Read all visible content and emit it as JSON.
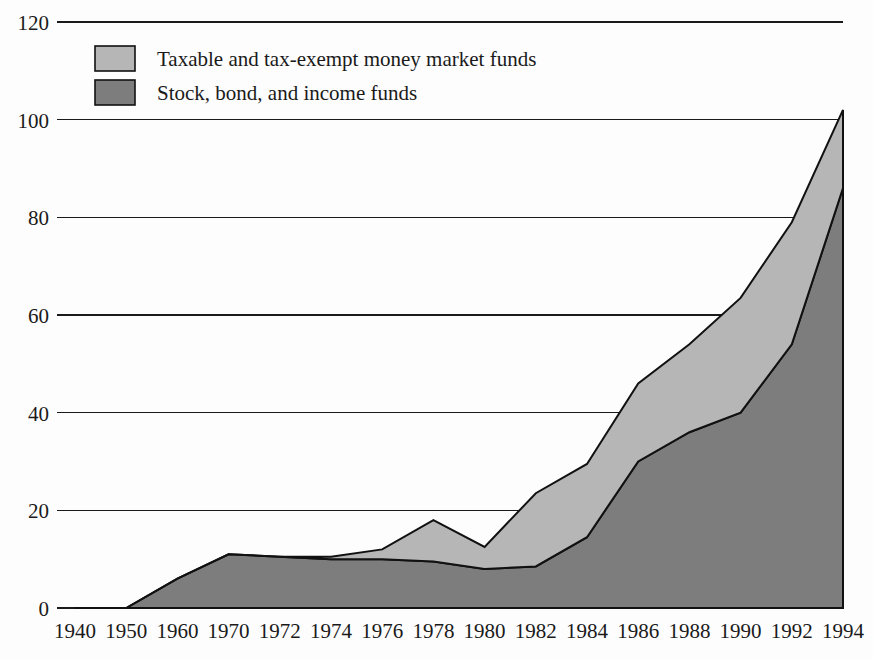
{
  "chart_data": {
    "type": "area",
    "stacked": true,
    "title": "",
    "subtitle": "",
    "xlabel": "",
    "ylabel": "",
    "categories": [
      "1940",
      "1950",
      "1960",
      "1970",
      "1972",
      "1974",
      "1976",
      "1978",
      "1980",
      "1982",
      "1984",
      "1986",
      "1988",
      "1990",
      "1992",
      "1994"
    ],
    "x": [
      1940,
      1950,
      1960,
      1970,
      1972,
      1974,
      1976,
      1978,
      1980,
      1982,
      1984,
      1986,
      1988,
      1990,
      1992,
      1994
    ],
    "series": [
      {
        "name": "Stock, bond, and income funds",
        "color": "#7d7d7d",
        "values": [
          0,
          0,
          6,
          11,
          10.5,
          10,
          10,
          9.5,
          8,
          8.5,
          14.5,
          30,
          36,
          40,
          54,
          86
        ]
      },
      {
        "name": "Taxable and tax-exempt money market funds",
        "color": "#b6b6b6",
        "values": [
          0,
          0,
          0,
          0,
          0,
          0.5,
          2,
          8.5,
          4.5,
          15,
          15,
          16,
          18,
          23.5,
          25,
          16
        ]
      }
    ],
    "totals": [
      0,
      0,
      6,
      11,
      10.5,
      10.5,
      12,
      18,
      12.5,
      23.5,
      29.5,
      46,
      54,
      63.5,
      79,
      102
    ],
    "ylim": [
      0,
      120
    ],
    "yticks": [
      0,
      20,
      40,
      60,
      80,
      100,
      120
    ],
    "ytick_labels": [
      "0",
      "20",
      "40",
      "60",
      "80",
      "100",
      "120"
    ],
    "grid": true,
    "grid_axis": "y",
    "legend_position": "upper-left-inside",
    "annotations": []
  },
  "legend": {
    "items": [
      {
        "label": "Taxable and tax-exempt money market funds",
        "color": "#b6b6b6"
      },
      {
        "label": "Stock, bond, and income funds",
        "color": "#7d7d7d"
      }
    ]
  },
  "axes": {
    "y_labels": [
      "120",
      "100",
      "80",
      "60",
      "40",
      "20",
      "0"
    ],
    "x_labels": [
      "1940",
      "1950",
      "1960",
      "1970",
      "1972",
      "1974",
      "1976",
      "1978",
      "1980",
      "1982",
      "1984",
      "1986",
      "1988",
      "1990",
      "1992",
      "1994"
    ]
  },
  "colors": {
    "background": "#fdfdfd",
    "axis": "#1a1a1a",
    "light_series": "#b6b6b6",
    "dark_series": "#7d7d7d",
    "outline": "#111111"
  }
}
